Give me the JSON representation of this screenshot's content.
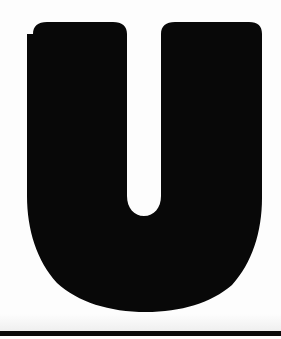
{
  "canvas": {
    "width": 281,
    "height": 339,
    "background_color": "#fdfdfd",
    "description": "Scanned high-contrast image of a single bold letterform on white paper"
  },
  "glyph": {
    "character": "U",
    "name": "letter-u",
    "case": "uppercase",
    "fill_color": "#080808",
    "style": "bold sans-serif",
    "bounds": {
      "left": 27,
      "top": 22,
      "right": 262,
      "bottom": 312,
      "width": 235,
      "height": 290
    },
    "counter": {
      "name": "inner-gap",
      "left": 127,
      "top": 22,
      "right": 165,
      "bottom": 217,
      "fill_color": "#fdfdfd"
    }
  },
  "bottom_rule": {
    "name": "bottom-black-bar",
    "top": 331,
    "height": 5,
    "color": "#0a0a0a",
    "full_width": true
  },
  "paper_shade": {
    "top": 314,
    "height": 17,
    "color_top": "#fdfdfd",
    "color_bottom": "#efefef"
  }
}
